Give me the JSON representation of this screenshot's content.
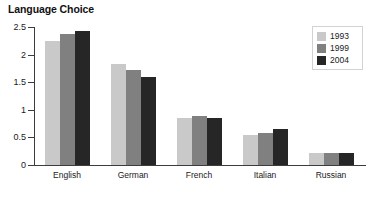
{
  "chart_data": {
    "type": "bar",
    "title": "Language Choice",
    "xlabel": "",
    "ylabel": "",
    "ylim": [
      0,
      2.5
    ],
    "yticks": [
      "0",
      "0.5",
      "1",
      "1.5",
      "2",
      "2.5"
    ],
    "ytick_values": [
      0,
      0.5,
      1,
      1.5,
      2,
      2.5
    ],
    "grid": false,
    "legend_position": "top-right",
    "categories": [
      "English",
      "German",
      "French",
      "Italian",
      "Russian"
    ],
    "series": [
      {
        "name": "1993",
        "color": "#c9c9c9",
        "values": [
          2.25,
          1.83,
          0.85,
          0.55,
          0.22
        ]
      },
      {
        "name": "1999",
        "color": "#808080",
        "values": [
          2.37,
          1.72,
          0.88,
          0.58,
          0.21
        ]
      },
      {
        "name": "2004",
        "color": "#262626",
        "values": [
          2.42,
          1.6,
          0.85,
          0.66,
          0.22
        ]
      }
    ]
  },
  "colors": {
    "axis": "#3c3c3c",
    "text": "#1a1a1a",
    "background": "#ffffff",
    "legend_border": "#d2d2d2"
  }
}
